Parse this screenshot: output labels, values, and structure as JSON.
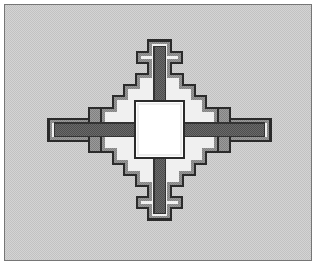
{
  "figure": {
    "title": "Cruciform stepped plan",
    "kind": "technical-line-drawing",
    "caption": "",
    "width": 317,
    "height": 266
  },
  "frame": {
    "margin_label": "page-margin",
    "border_color": "#767676",
    "border_width": 1,
    "margin": 4,
    "inner_bounds": {
      "x": 5,
      "y": 5,
      "width": 307,
      "height": 256
    }
  },
  "palette": {
    "page": "#ffffff",
    "background": "#cccccc",
    "background_dither_light": "#dedede",
    "background_dither_dark": "#bdbdbd",
    "outline": "#2b2b2b",
    "arm_fill": "#8c8c8c",
    "arm_fill_dither_dark": "#6e6e6e",
    "channel_fill": "#5a5a5a",
    "highlight": "#f2f2f2",
    "core_fill": "#ffffff",
    "shoulder_fill": "#9a9a9a"
  },
  "geometry": {
    "center": {
      "x": 159,
      "y": 130
    },
    "core_square": {
      "x": 135,
      "y": 101,
      "width": 49,
      "height": 57
    },
    "arms": [
      {
        "name": "north-arm",
        "direction": "up",
        "length": 78,
        "half_width": 11,
        "crossbar_offset": 22,
        "crossbar_half_length": 22,
        "crossbar_thickness": 11
      },
      {
        "name": "south-arm",
        "direction": "down",
        "length": 77,
        "half_width": 11,
        "crossbar_offset": 22,
        "crossbar_half_length": 22,
        "crossbar_thickness": 11
      },
      {
        "name": "west-arm",
        "direction": "left",
        "length": 111,
        "half_width": 11,
        "crossbar_offset": 24,
        "crossbar_half_length": 20,
        "crossbar_thickness": 11
      },
      {
        "name": "east-arm",
        "direction": "right",
        "length": 112,
        "half_width": 11,
        "crossbar_offset": 24,
        "crossbar_half_length": 20,
        "crossbar_thickness": 11
      }
    ],
    "shoulder_steps": 2,
    "shoulder_step_size": {
      "x": 12,
      "y": 11
    }
  },
  "labels": {
    "core": "central-chamber",
    "north": "north-wing",
    "south": "south-wing",
    "east": "east-wing",
    "west": "west-wing"
  }
}
